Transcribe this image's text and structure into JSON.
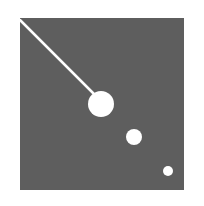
{
  "image": {
    "background_color": "#ffffff",
    "square": {
      "x": 20,
      "y": 18,
      "width": 164,
      "height": 172,
      "color": "#5e5e5e"
    },
    "line": {
      "x1": 20,
      "y1": 20,
      "x2": 98,
      "y2": 98,
      "color": "#ffffff",
      "width": 2.5
    },
    "circles": [
      {
        "cx": 101,
        "cy": 104,
        "r": 13,
        "color": "#ffffff"
      },
      {
        "cx": 134,
        "cy": 137,
        "r": 8,
        "color": "#ffffff"
      },
      {
        "cx": 168,
        "cy": 171,
        "r": 5,
        "color": "#ffffff"
      }
    ]
  }
}
